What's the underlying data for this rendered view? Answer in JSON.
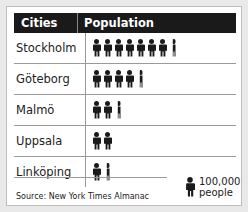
{
  "table": {
    "headers": [
      "Cities",
      "Population"
    ],
    "rows": [
      {
        "city": "Stockholm",
        "icons": 7.25
      },
      {
        "city": "Göteborg",
        "icons": 4.25
      },
      {
        "city": "Malmö",
        "icons": 2.25
      },
      {
        "city": "Uppsala",
        "icons": 2.0
      },
      {
        "city": "Linköping",
        "icons": 1.25
      }
    ]
  },
  "legend": {
    "line1": "100,000",
    "line2": "people",
    "icon": "person-icon"
  },
  "source": "Source:  New York Times Almanac",
  "colors": {
    "header_bg": "#1a1a1a",
    "icon": "#1a1a1a",
    "background": "#ffffff"
  },
  "chart_data": {
    "type": "table",
    "title": "",
    "columns": [
      "Cities",
      "Population"
    ],
    "categories": [
      "Stockholm",
      "Göteborg",
      "Malmö",
      "Uppsala",
      "Linköping"
    ],
    "values": [
      725000,
      425000,
      225000,
      200000,
      125000
    ],
    "icon_counts": [
      7.25,
      4.25,
      2.25,
      2.0,
      1.25
    ],
    "unit": "1 icon = 100,000 people",
    "source": "New York Times Almanac"
  }
}
